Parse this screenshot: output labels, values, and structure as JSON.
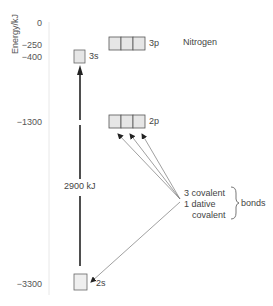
{
  "diagram": {
    "title": "Nitrogen",
    "axis": {
      "label": "Energy/kJ",
      "ticks": [
        {
          "label": "0",
          "value": 0
        },
        {
          "label": "−250",
          "value": -250
        },
        {
          "label": "−400",
          "value": -400
        },
        {
          "label": "−1300",
          "value": -1300
        },
        {
          "label": "−3300",
          "value": -3300
        }
      ]
    },
    "orbitals": [
      {
        "name": "3s",
        "label": "3s",
        "energy": -400,
        "boxes": 1
      },
      {
        "name": "3p",
        "label": "3p",
        "energy": -250,
        "boxes": 3
      },
      {
        "name": "2p",
        "label": "2p",
        "energy": -1300,
        "boxes": 3
      },
      {
        "name": "2s",
        "label": "2s",
        "energy": -3300,
        "boxes": 1
      }
    ],
    "promotion_arrow": {
      "from": "2s",
      "to": "3s",
      "label": "2900 kJ"
    },
    "annotation": {
      "lines": [
        "3 covalent",
        "1 dative",
        "covalent"
      ],
      "brace_label": "bonds",
      "arrows_to": [
        "2p-box-1",
        "2p-box-2",
        "2p-box-3",
        "2s-box"
      ]
    },
    "colors": {
      "box_fill": "#e6e6e6",
      "box_stroke": "#555555",
      "arrow": "#222222",
      "thin_arrow": "#666666"
    }
  }
}
